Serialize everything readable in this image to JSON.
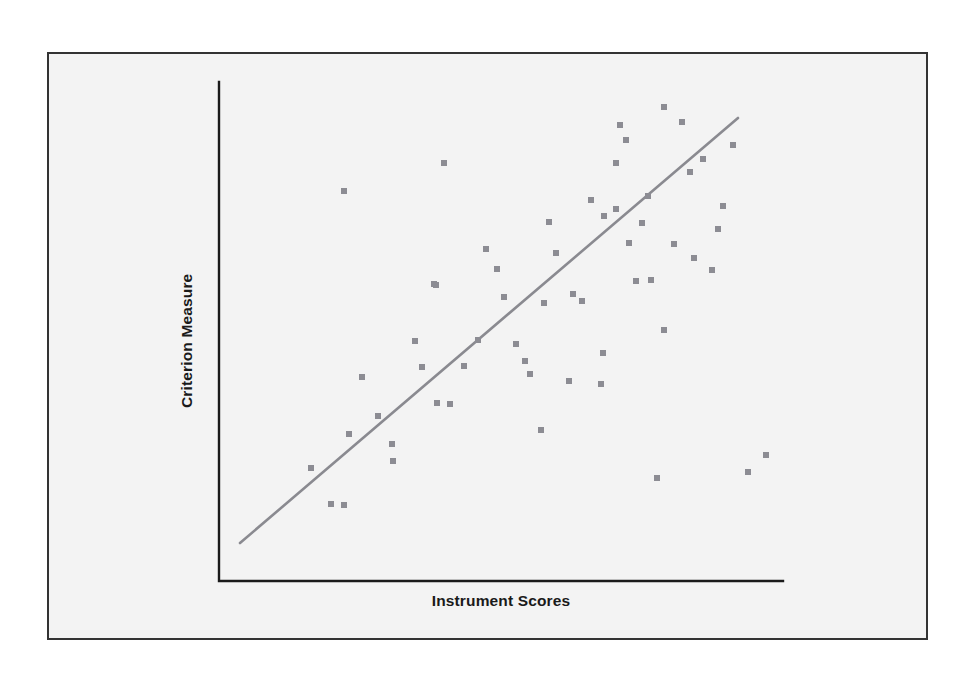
{
  "figure": {
    "kind": "scatter-plot-figure",
    "frame": {
      "x": 47,
      "y": 52,
      "width": 881,
      "height": 588,
      "border_color": "#333333",
      "background_color": "#f3f3f3"
    }
  },
  "chart_data": {
    "type": "scatter",
    "title": "",
    "subtitle": "",
    "xlabel": "Instrument Scores",
    "ylabel": "Criterion Measure",
    "xlim": [
      0,
      100
    ],
    "ylim": [
      0,
      100
    ],
    "grid": false,
    "legend": null,
    "axis": {
      "style": "L-shaped spine, no tick marks, no tick labels",
      "color": "#1a1a1a",
      "origin_px": [
        219,
        581
      ],
      "y_top_px": [
        219,
        82
      ],
      "x_right_px": [
        783,
        581
      ]
    },
    "marker": {
      "shape": "square",
      "size_px": 6,
      "color": "#8c8c93"
    },
    "annotations": [
      {
        "kind": "trend-line",
        "label": "regression line",
        "color": "#8a8a90",
        "width_px": 2.6,
        "x_px": [
          240,
          738
        ],
        "y_px": [
          543,
          118
        ],
        "x_data": [
          3.7,
          92.0
        ],
        "y_data": [
          7.6,
          92.8
        ]
      }
    ],
    "points_px": [
      [
        344,
        191
      ],
      [
        444,
        163
      ],
      [
        486,
        249
      ],
      [
        616,
        163
      ],
      [
        626,
        140
      ],
      [
        664,
        107
      ],
      [
        682,
        122
      ],
      [
        703,
        159
      ],
      [
        733,
        145
      ],
      [
        616,
        209
      ],
      [
        642,
        223
      ],
      [
        723,
        206
      ],
      [
        718,
        229
      ],
      [
        629,
        243
      ],
      [
        674,
        244
      ],
      [
        636,
        281
      ],
      [
        651,
        280
      ],
      [
        573,
        294
      ],
      [
        582,
        301
      ],
      [
        556,
        253
      ],
      [
        497,
        269
      ],
      [
        436,
        285
      ],
      [
        434,
        284
      ],
      [
        591,
        200
      ],
      [
        604,
        216
      ],
      [
        415,
        341
      ],
      [
        464,
        366
      ],
      [
        362,
        377
      ],
      [
        422,
        367
      ],
      [
        516,
        344
      ],
      [
        525,
        361
      ],
      [
        530,
        374
      ],
      [
        603,
        353
      ],
      [
        541,
        430
      ],
      [
        437,
        403
      ],
      [
        450,
        404
      ],
      [
        378,
        416
      ],
      [
        349,
        434
      ],
      [
        392,
        444
      ],
      [
        393,
        461
      ],
      [
        311,
        468
      ],
      [
        331,
        504
      ],
      [
        344,
        505
      ],
      [
        657,
        478
      ],
      [
        748,
        472
      ],
      [
        766,
        455
      ],
      [
        690,
        172
      ],
      [
        694,
        258
      ],
      [
        664,
        330
      ],
      [
        569,
        381
      ],
      [
        601,
        384
      ],
      [
        544,
        303
      ],
      [
        549,
        222
      ],
      [
        478,
        340
      ],
      [
        504,
        297
      ],
      [
        620,
        125
      ],
      [
        648,
        196
      ],
      [
        712,
        270
      ]
    ],
    "points_data": [
      [
        22.2,
        67.7
      ],
      [
        40.0,
        73.0
      ],
      [
        47.4,
        57.6
      ],
      [
        70.4,
        73.1
      ],
      [
        72.2,
        77.5
      ],
      [
        79.0,
        84.3
      ],
      [
        82.2,
        81.3
      ],
      [
        85.9,
        74.0
      ],
      [
        91.3,
        76.6
      ],
      [
        70.4,
        65.1
      ],
      [
        75.0,
        62.5
      ],
      [
        89.5,
        65.7
      ],
      [
        88.6,
        61.4
      ],
      [
        72.8,
        59.0
      ],
      [
        80.9,
        58.8
      ],
      [
        74.2,
        51.4
      ],
      [
        76.9,
        51.6
      ],
      [
        62.8,
        49.0
      ],
      [
        64.4,
        47.8
      ],
      [
        59.8,
        57.0
      ],
      [
        49.3,
        59.9
      ],
      [
        38.5,
        56.9
      ],
      [
        38.1,
        57.1
      ],
      [
        65.9,
        66.3
      ],
      [
        68.3,
        63.4
      ],
      [
        34.8,
        48.0
      ],
      [
        43.5,
        42.9
      ],
      [
        25.4,
        40.8
      ],
      [
        36.0,
        42.9
      ],
      [
        52.8,
        47.5
      ],
      [
        54.4,
        44.1
      ],
      [
        55.3,
        41.5
      ],
      [
        68.3,
        45.7
      ],
      [
        57.3,
        30.2
      ],
      [
        38.7,
        35.5
      ],
      [
        41.1,
        35.3
      ],
      [
        28.3,
        33.1
      ],
      [
        23.1,
        29.5
      ],
      [
        30.8,
        27.5
      ],
      [
        31.0,
        24.1
      ],
      [
        16.3,
        22.7
      ],
      [
        19.9,
        15.5
      ],
      [
        22.2,
        15.3
      ],
      [
        77.8,
        20.6
      ],
      [
        94.0,
        21.8
      ],
      [
        97.2,
        25.0
      ],
      [
        83.6,
        71.2
      ],
      [
        84.3,
        54.0
      ],
      [
        78.9,
        39.9
      ],
      [
        62.0,
        34.8
      ],
      [
        67.7,
        34.2
      ],
      [
        57.8,
        50.2
      ],
      [
        58.7,
        65.8
      ],
      [
        46.1,
        47.8
      ],
      [
        50.7,
        56.0
      ],
      [
        71.2,
        80.6
      ],
      [
        76.2,
        67.1
      ],
      [
        87.5,
        54.7
      ]
    ]
  },
  "labels": {
    "y_axis": "Criterion Measure",
    "x_axis": "Instrument Scores"
  }
}
